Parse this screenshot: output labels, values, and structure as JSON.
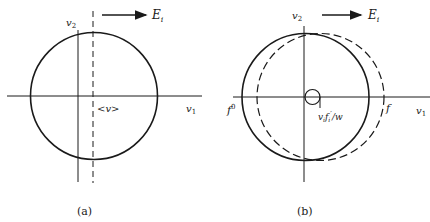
{
  "panel_a": {
    "caption": "(a)",
    "axis_x_label": "v",
    "axis_x_sub": "1",
    "axis_y_label": "v",
    "axis_y_sub": "2",
    "field_label": "E",
    "field_sub": "i",
    "mean_label": "<v>"
  },
  "panel_b": {
    "caption": "(b)",
    "axis_x_label": "v",
    "axis_x_sub": "1",
    "axis_y_label": "v",
    "axis_y_sub": "2",
    "field_label": "E",
    "field_sub": "i",
    "f0_label": "f",
    "f0_sup": "0",
    "f_label": "f",
    "shift_label_v": "v",
    "shift_label_vsub": "i",
    "shift_label_f": "f",
    "shift_label_fsub": "i",
    "shift_label_prime": "′",
    "shift_label_rest": "/w"
  },
  "colors": {
    "ink": "#1a1a1a",
    "background": "#ffffff"
  }
}
